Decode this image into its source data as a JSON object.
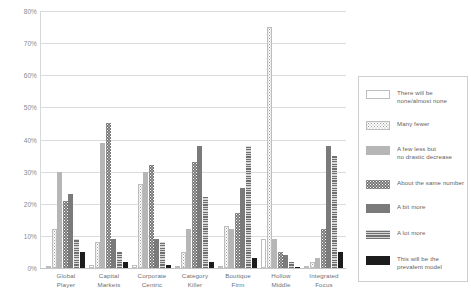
{
  "chart_data": {
    "type": "bar",
    "title": "",
    "xlabel": "",
    "ylabel": "",
    "ylim": [
      0,
      80
    ],
    "grid": true,
    "legend_position": "right",
    "ytick_labels": [
      "80%",
      "70%",
      "60%",
      "50%",
      "40%",
      "30%",
      "20%",
      "10%",
      "0%"
    ],
    "ytick_values": [
      80,
      70,
      60,
      50,
      40,
      30,
      20,
      10,
      0
    ],
    "categories": [
      "Global Player",
      "Capital Markets",
      "Corporate Centric",
      "Category Killer",
      "Boutique Firm",
      "Hollow Middle",
      "Integrated Focus"
    ],
    "category_lines": [
      [
        "Global",
        "Player"
      ],
      [
        "Capital",
        "Markets"
      ],
      [
        "Corporate",
        "Centric"
      ],
      [
        "Category",
        "Killer"
      ],
      [
        "Boutique",
        "Firm"
      ],
      [
        "Hollow",
        "Middle"
      ],
      [
        "Integrated",
        "Focus"
      ]
    ],
    "series": [
      {
        "name": "There will be none/almost none",
        "name_lines": [
          "There will be",
          "none/almost none"
        ],
        "fill": "f-none",
        "color": "#ffffff",
        "values": [
          0,
          1,
          1,
          0,
          0,
          9,
          0
        ]
      },
      {
        "name": "Many fewer",
        "name_lines": [
          "Many fewer"
        ],
        "fill": "f-manyfewer",
        "color": "#e8e8e8",
        "values": [
          12,
          8,
          26,
          5,
          13,
          75,
          2
        ]
      },
      {
        "name": "A few less but no drastic decrease",
        "name_lines": [
          "A few less but",
          "no drastic decrease"
        ],
        "fill": "f-fewless",
        "color": "#b6b6b6",
        "values": [
          30,
          39,
          30,
          12,
          12,
          9,
          3
        ]
      },
      {
        "name": "About the same number",
        "name_lines": [
          "About the same number"
        ],
        "fill": "f-same",
        "color": "#767676",
        "values": [
          21,
          45,
          32,
          33,
          17,
          5,
          12
        ]
      },
      {
        "name": "A bit more",
        "name_lines": [
          "A bit more"
        ],
        "fill": "f-bitmore",
        "color": "#7a7a7a",
        "values": [
          23,
          9,
          9,
          38,
          25,
          4,
          38
        ]
      },
      {
        "name": "A lot more",
        "name_lines": [
          "A lot more"
        ],
        "fill": "f-lotmore",
        "color": "#6f6f6f",
        "values": [
          9,
          5,
          8,
          22,
          38,
          2,
          35
        ]
      },
      {
        "name": "This will be the prevalent model",
        "name_lines": [
          "This will be the",
          "prevalent model"
        ],
        "fill": "f-prevalent",
        "color": "#1c1c1c",
        "values": [
          5,
          2,
          1,
          2,
          3,
          0,
          5
        ]
      }
    ]
  }
}
